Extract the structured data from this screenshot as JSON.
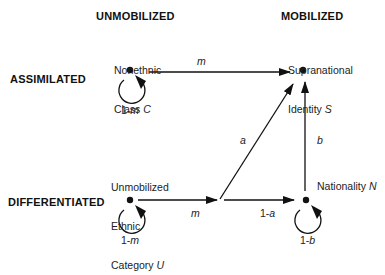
{
  "columns": {
    "left": "UNMOBILIZED",
    "right": "MOBILIZED"
  },
  "rows": {
    "top": "ASSIMILATED",
    "bottom": "DIFFERENTIATED"
  },
  "nodes": {
    "C": {
      "line1": "Nonethnic",
      "line2": "Class ",
      "symbol": "C",
      "self_loop": "1-m"
    },
    "S": {
      "line1": "Supranational",
      "line2": "Identity ",
      "symbol": "S"
    },
    "U": {
      "line1": "Unmobilized",
      "line2": "Ethnic",
      "line3": "Category ",
      "symbol": "U",
      "self_loop": "1-m"
    },
    "N": {
      "line1": "Nationality ",
      "symbol": "N",
      "self_loop": "1-b"
    }
  },
  "edges": {
    "C_to_S": "m",
    "U_to_junction": "m",
    "junction_to_S": "a",
    "junction_to_N": "1-a",
    "N_to_S": "b"
  },
  "colors": {
    "ink": "#111111",
    "background": "#ffffff"
  }
}
